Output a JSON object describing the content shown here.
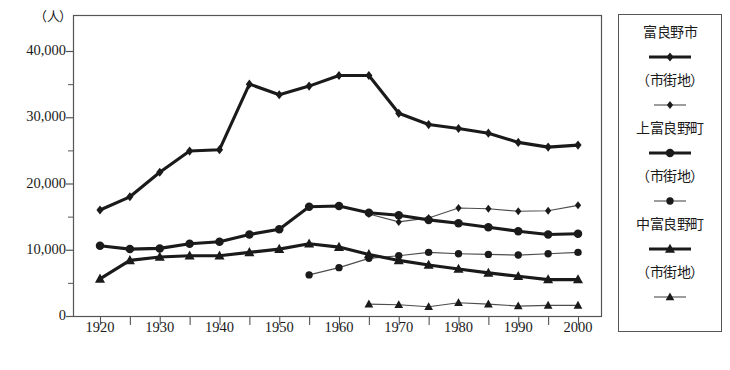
{
  "chart_data": {
    "type": "line",
    "title": "",
    "subtitle": "",
    "unit_label": "（人）",
    "xlabel": "",
    "ylabel": "",
    "xlim": [
      1918,
      2002
    ],
    "ylim": [
      0,
      43000
    ],
    "xticks": [
      1920,
      1930,
      1940,
      1950,
      1960,
      1970,
      1980,
      1990,
      2000
    ],
    "xtick_labels": [
      "1920",
      "1930",
      "1940",
      "1950",
      "1960",
      "1970",
      "1980",
      "1990",
      "2000"
    ],
    "xminor_step": 5,
    "yticks": [
      0,
      10000,
      20000,
      30000,
      40000
    ],
    "ytick_labels": [
      "0",
      "10,000",
      "20,000",
      "30,000",
      "40,000"
    ],
    "yminor": [
      5000,
      15000,
      25000,
      35000
    ],
    "grid": false,
    "legend_position": "right-outside",
    "series": [
      {
        "name": "富良野市",
        "marker": "diamond",
        "line": "thick",
        "x": [
          1920,
          1925,
          1930,
          1935,
          1940,
          1945,
          1950,
          1955,
          1960,
          1965,
          1970,
          1975,
          1980,
          1985,
          1990,
          1995,
          2000
        ],
        "values": [
          16000,
          18000,
          21700,
          24900,
          25100,
          35000,
          33400,
          34700,
          36300,
          36300,
          30600,
          28900,
          28300,
          27600,
          26200,
          25500,
          25800
        ]
      },
      {
        "name": "富良野市（市街地）",
        "marker": "diamond",
        "line": "thin",
        "x": [
          1965,
          1970,
          1975,
          1980,
          1985,
          1990,
          1995,
          2000
        ],
        "values": [
          15400,
          14200,
          14800,
          16300,
          16200,
          15800,
          15900,
          16700
        ]
      },
      {
        "name": "上富良野町",
        "marker": "circle",
        "line": "thick",
        "x": [
          1920,
          1925,
          1930,
          1935,
          1940,
          1945,
          1950,
          1955,
          1960,
          1965,
          1970,
          1975,
          1980,
          1985,
          1990,
          1995,
          2000
        ],
        "values": [
          10600,
          10100,
          10200,
          10900,
          11200,
          12300,
          13100,
          16500,
          16600,
          15600,
          15200,
          14500,
          14000,
          13400,
          12800,
          12300,
          12400
        ]
      },
      {
        "name": "上富良野町（市街地）",
        "marker": "circle",
        "line": "thin",
        "x": [
          1955,
          1960,
          1965,
          1970,
          1975,
          1980,
          1985,
          1990,
          1995,
          2000
        ],
        "values": [
          6200,
          7300,
          8700,
          9100,
          9600,
          9400,
          9300,
          9200,
          9400,
          9600
        ]
      },
      {
        "name": "中富良野町",
        "marker": "triangle",
        "line": "thick",
        "x": [
          1920,
          1925,
          1930,
          1935,
          1940,
          1945,
          1950,
          1955,
          1960,
          1965,
          1970,
          1975,
          1980,
          1985,
          1990,
          1995,
          2000
        ],
        "values": [
          5600,
          8400,
          8900,
          9100,
          9100,
          9600,
          10100,
          10900,
          10400,
          9300,
          8400,
          7700,
          7100,
          6500,
          6000,
          5500,
          5500
        ]
      },
      {
        "name": "中富良野町（市街地）",
        "marker": "triangle",
        "line": "thin",
        "x": [
          1965,
          1970,
          1975,
          1980,
          1985,
          1990,
          1995,
          2000
        ],
        "values": [
          1800,
          1700,
          1400,
          2000,
          1800,
          1500,
          1600,
          1600
        ]
      }
    ]
  },
  "legend": {
    "rows": [
      {
        "label": "富良野市",
        "marker": "diamond",
        "line": "thick",
        "type": "text"
      },
      {
        "label": "",
        "marker": "diamond",
        "line": "thick",
        "type": "sample"
      },
      {
        "label": "（市街地）",
        "marker": "diamond",
        "line": "thin",
        "type": "text"
      },
      {
        "label": "",
        "marker": "diamond",
        "line": "thin",
        "type": "sample"
      },
      {
        "label": "上富良野町",
        "marker": "circle",
        "line": "thick",
        "type": "text"
      },
      {
        "label": "",
        "marker": "circle",
        "line": "thick",
        "type": "sample"
      },
      {
        "label": "（市街地）",
        "marker": "circle",
        "line": "thin",
        "type": "text"
      },
      {
        "label": "",
        "marker": "circle",
        "line": "thin",
        "type": "sample"
      },
      {
        "label": "中富良野町",
        "marker": "triangle",
        "line": "thick",
        "type": "text"
      },
      {
        "label": "",
        "marker": "triangle",
        "line": "thick",
        "type": "sample"
      },
      {
        "label": "（市街地）",
        "marker": "triangle",
        "line": "thin",
        "type": "text"
      },
      {
        "label": "",
        "marker": "triangle",
        "line": "thin",
        "type": "sample"
      }
    ]
  },
  "colors": {
    "ink": "#1a1a1a",
    "axis": "#555555",
    "thin_line": "#4d4d4d",
    "background": "#ffffff"
  },
  "caption": ""
}
